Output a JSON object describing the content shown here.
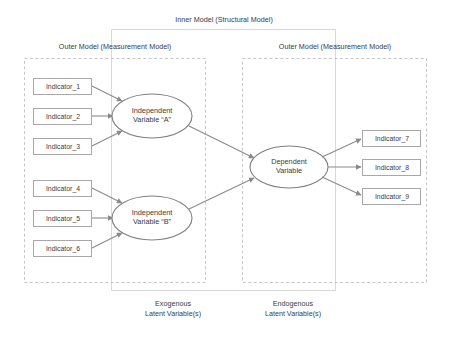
{
  "diagram": {
    "title_inner": "Inner Model (Structural Model)",
    "outer_left_title": "Outer Model (Measurement Model)",
    "outer_right_title": "Outer Model (Measurement Model)",
    "exogenous_label_line1": "Exogenous",
    "exogenous_label_line2": "Latent Variable(s)",
    "endogenous_label_line1": "Endogenous",
    "endogenous_label_line2": "Latent Variable(s)",
    "colors": {
      "stroke": "#808080",
      "text": "#3a3a3a",
      "dashed_border": "#c9c9c9",
      "solid_border": "#d4d4d4",
      "background": "#ffffff"
    },
    "indicators_left_top": [
      {
        "id": "indicator-1",
        "label": "Indicator_1"
      },
      {
        "id": "indicator-2",
        "label": "Indicator_2"
      },
      {
        "id": "indicator-3",
        "label": "Indicator_3"
      }
    ],
    "indicators_left_bottom": [
      {
        "id": "indicator-4",
        "label": "Indicator_4"
      },
      {
        "id": "indicator-5",
        "label": "Indicator_5"
      },
      {
        "id": "indicator-6",
        "label": "Indicator_6"
      }
    ],
    "indicators_right": [
      {
        "id": "indicator-7",
        "label": "Indicator_7"
      },
      {
        "id": "indicator-8",
        "label": "Indicator_8"
      },
      {
        "id": "indicator-9",
        "label": "Indicator_9"
      }
    ],
    "latent_variables": [
      {
        "id": "independent-a",
        "line1": "Independent",
        "line2": "Variable “A”"
      },
      {
        "id": "independent-b",
        "line1": "Independent",
        "line2": "Variable “B”"
      },
      {
        "id": "dependent",
        "line1": "Dependent",
        "line2": "Variable"
      }
    ]
  }
}
